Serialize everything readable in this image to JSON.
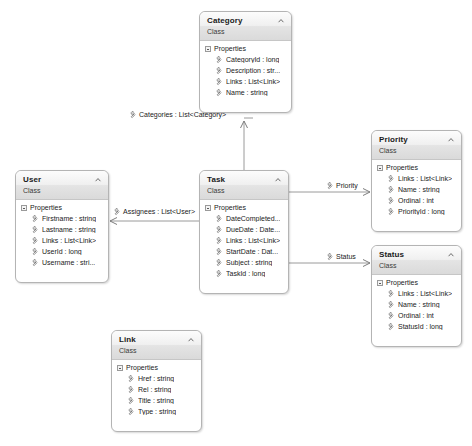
{
  "diagram": {
    "background_color": "#ffffff",
    "shape_border_color": "#b4b4b4",
    "header_gradient_top": "#fcfcfc",
    "header_gradient_bottom": "#dadada",
    "connector_color": "#808080",
    "stereotype": "Class",
    "compartment_label": "Properties",
    "icons": {
      "collapse": "chevron-up-icon",
      "expander": "collapse-expander-icon",
      "property": "property-wrench-icon"
    }
  },
  "classes": [
    {
      "id": "category",
      "name": "Category",
      "stereotype": "Class",
      "compartment": "Properties",
      "members": [
        "CategoryId : long",
        "Description : str...",
        "Links : List<Link>",
        "Name : string"
      ],
      "x": 199,
      "y": 11,
      "w": 93,
      "h": 102
    },
    {
      "id": "user",
      "name": "User",
      "stereotype": "Class",
      "compartment": "Properties",
      "members": [
        "Firstname : string",
        "Lastname : string",
        "Links : List<Link>",
        "UserId : long",
        "Username : stri..."
      ],
      "x": 15,
      "y": 170,
      "w": 94,
      "h": 113
    },
    {
      "id": "task",
      "name": "Task",
      "stereotype": "Class",
      "compartment": "Properties",
      "members": [
        "DateCompleted...",
        "DueDate : Date...",
        "Links : List<Link>",
        "StartDate : Dat...",
        "Subject : string",
        "TaskId : long"
      ],
      "x": 199,
      "y": 170,
      "w": 90,
      "h": 124
    },
    {
      "id": "priority",
      "name": "Priority",
      "stereotype": "Class",
      "compartment": "Properties",
      "members": [
        "Links : List<Link>",
        "Name : string",
        "Ordinal : int",
        "PriorityId : long"
      ],
      "x": 371,
      "y": 130,
      "w": 91,
      "h": 102
    },
    {
      "id": "status",
      "name": "Status",
      "stereotype": "Class",
      "compartment": "Properties",
      "members": [
        "Links : List<Link>",
        "Name : string",
        "Ordinal : int",
        "StatusId : long"
      ],
      "x": 371,
      "y": 245,
      "w": 91,
      "h": 102
    },
    {
      "id": "link",
      "name": "Link",
      "stereotype": "Class",
      "compartment": "Properties",
      "members": [
        "Href : string",
        "Rel : string",
        "Title : string",
        "Type : string"
      ],
      "x": 111,
      "y": 330,
      "w": 91,
      "h": 102
    }
  ],
  "associations": [
    {
      "id": "categories",
      "label": "Categories : List<Category>",
      "source": "task",
      "target": "category",
      "x": 126,
      "y": 110
    },
    {
      "id": "assignees",
      "label": "Assignees : List<User>",
      "source": "task",
      "target": "user",
      "x": 110,
      "y": 207
    },
    {
      "id": "priority",
      "label": "Priority",
      "source": "task",
      "target": "priority",
      "x": 323,
      "y": 181
    },
    {
      "id": "status",
      "label": "Status",
      "source": "task",
      "target": "status",
      "x": 323,
      "y": 252
    }
  ]
}
